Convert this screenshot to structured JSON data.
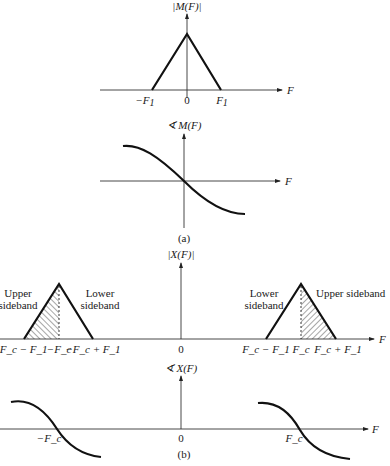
{
  "figure": {
    "part_a": {
      "caption": "(a)",
      "magnitude": {
        "ylabel": "|M(F)|",
        "xlabel": "F",
        "ticks": {
          "neg": "−F",
          "neg_sub": "1",
          "zero": "0",
          "pos": "F",
          "pos_sub": "1"
        }
      },
      "phase": {
        "ylabel": "∢ M(F)",
        "xlabel": "F"
      }
    },
    "part_b": {
      "caption": "(b)",
      "magnitude": {
        "ylabel": "|X(F)|",
        "xlabel": "F",
        "left_upper_label_1": "Upper",
        "left_upper_label_2": "sideband",
        "left_lower_label_1": "Lower",
        "left_lower_label_2": "sideband",
        "right_lower_label_1": "Lower",
        "right_lower_label_2": "sideband",
        "right_upper_label": "Upper sideband",
        "ticks": {
          "t1": "−F_c − F_1",
          "t2": "−F_c",
          "t3": "−F_c + F_1",
          "t4": "0",
          "t5": "F_c − F_1",
          "t6": "F_c",
          "t7": "F_c + F_1"
        }
      },
      "phase": {
        "ylabel": "∢ X(F)",
        "xlabel": "F",
        "zero": "0",
        "neg_fc": "−F_c",
        "pos_fc": "F_c"
      }
    }
  }
}
